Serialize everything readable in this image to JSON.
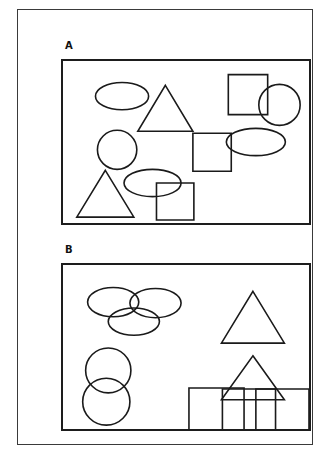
{
  "figure": {
    "background_color": "#ffffff",
    "outline_color": "#3a3a3a",
    "shape_stroke_color": "#1a1a1a",
    "panel_border_color": "#1d1d1d"
  },
  "panels": [
    {
      "id": "A",
      "label": "A",
      "arrangement": "random",
      "shape_counts": {
        "ellipse": 3,
        "circle": 2,
        "triangle": 2,
        "square": 3
      },
      "total_shapes": 10,
      "shapes": [
        {
          "name": "ellipse",
          "cx": 60,
          "cy": 36,
          "rx": 27,
          "ry": 14
        },
        {
          "name": "triangle",
          "cx": 104,
          "cy": 48,
          "w": 56,
          "h": 47
        },
        {
          "name": "circle",
          "cx": 55,
          "cy": 91,
          "r": 20
        },
        {
          "name": "ellipse",
          "cx": 91,
          "cy": 125,
          "rx": 29,
          "ry": 14
        },
        {
          "name": "triangle",
          "cx": 43,
          "cy": 136,
          "w": 58,
          "h": 48
        },
        {
          "name": "square",
          "x": 95,
          "y": 125,
          "w": 38,
          "h": 38
        },
        {
          "name": "square",
          "x": 132,
          "y": 74,
          "w": 39,
          "h": 39
        },
        {
          "name": "square",
          "x": 168,
          "y": 14,
          "w": 40,
          "h": 41
        },
        {
          "name": "circle",
          "cx": 220,
          "cy": 45,
          "r": 21
        },
        {
          "name": "ellipse",
          "cx": 196,
          "cy": 83,
          "rx": 30,
          "ry": 14
        }
      ]
    },
    {
      "id": "B",
      "label": "B",
      "arrangement": "clustered",
      "shape_counts": {
        "ellipse": 3,
        "circle": 2,
        "triangle": 2,
        "square": 3
      },
      "total_shapes": 10,
      "shapes": [
        {
          "name": "ellipse",
          "cx": 51,
          "cy": 38,
          "rx": 26,
          "ry": 15
        },
        {
          "name": "ellipse",
          "cx": 94,
          "cy": 39,
          "rx": 26,
          "ry": 15
        },
        {
          "name": "ellipse",
          "cx": 72,
          "cy": 58,
          "rx": 26,
          "ry": 14
        },
        {
          "name": "circle",
          "cx": 46,
          "cy": 108,
          "r": 23
        },
        {
          "name": "circle",
          "cx": 44,
          "cy": 140,
          "r": 24
        },
        {
          "name": "triangle",
          "cx": 193,
          "cy": 27,
          "w": 64,
          "h": 53
        },
        {
          "name": "triangle",
          "cx": 193,
          "cy": 93,
          "w": 64,
          "h": 45
        },
        {
          "name": "square",
          "x": 128,
          "y": 126,
          "w": 56,
          "h": 55
        },
        {
          "name": "square",
          "x": 162,
          "y": 127,
          "w": 54,
          "h": 54
        },
        {
          "name": "square",
          "x": 196,
          "y": 127,
          "w": 54,
          "h": 54
        }
      ]
    }
  ]
}
